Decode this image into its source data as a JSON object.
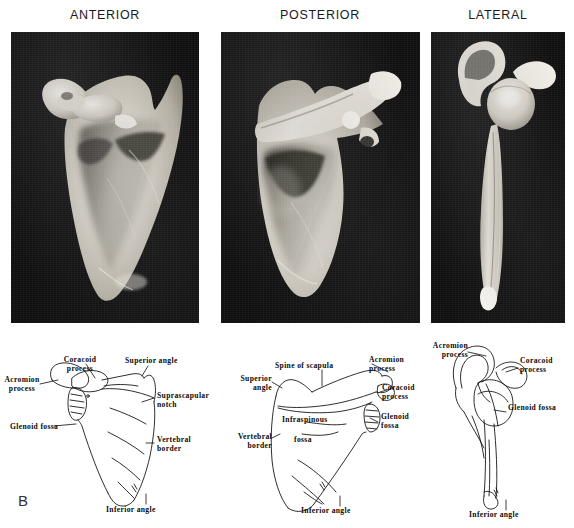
{
  "figure": {
    "panel_letter": "B",
    "background_color": "#ffffff",
    "ink_color": "#0a0a0a",
    "photo_background_color": "#0d0d0d",
    "bone_color": "#d8d4cc"
  },
  "columns": [
    {
      "heading": "ANTERIOR",
      "heading_x": 105,
      "heading_y": 8
    },
    {
      "heading": "POSTERIOR",
      "heading_x": 320,
      "heading_y": 8
    },
    {
      "heading": "LATERAL",
      "heading_x": 498,
      "heading_y": 8
    }
  ],
  "photo_panels": [
    {
      "name": "anterior-photo",
      "x": 11,
      "y": 32,
      "width": 188,
      "height": 291
    },
    {
      "name": "posterior-photo",
      "x": 221,
      "y": 32,
      "width": 199,
      "height": 291
    },
    {
      "name": "lateral-photo",
      "x": 431,
      "y": 32,
      "width": 134,
      "height": 291
    }
  ],
  "diagrams": [
    {
      "name": "anterior-diagram",
      "view": "ANTERIOR",
      "labels": [
        {
          "text": "Acromion\nprocess",
          "x": 4,
          "y": 376,
          "align": "left"
        },
        {
          "text": "Coracoid\nprocess",
          "x": 72,
          "y": 357,
          "align": "center"
        },
        {
          "text": "Superior angle",
          "x": 127,
          "y": 358,
          "align": "left"
        },
        {
          "text": "Suprascapular\nnotch",
          "x": 156,
          "y": 392,
          "align": "left"
        },
        {
          "text": "Glenoid fossa",
          "x": 14,
          "y": 424,
          "align": "left"
        },
        {
          "text": "Vertebral\nborder",
          "x": 155,
          "y": 437,
          "align": "left"
        },
        {
          "text": "Inferior angle",
          "x": 106,
          "y": 507,
          "align": "left"
        }
      ]
    },
    {
      "name": "posterior-diagram",
      "view": "POSTERIOR",
      "labels": [
        {
          "text": "Spine of scapula",
          "x": 277,
          "y": 363,
          "align": "left"
        },
        {
          "text": "Acromion\nprocess",
          "x": 372,
          "y": 357,
          "align": "left"
        },
        {
          "text": "Superior\nangle",
          "x": 234,
          "y": 376,
          "align": "left"
        },
        {
          "text": "Coracoid\nprocess",
          "x": 382,
          "y": 385,
          "align": "left"
        },
        {
          "text": "Infraspinous",
          "x": 282,
          "y": 417,
          "align": "left"
        },
        {
          "text": "Glenoid\nfossa",
          "x": 380,
          "y": 414,
          "align": "left"
        },
        {
          "text": "Vertebral\nborder",
          "x": 230,
          "y": 434,
          "align": "left"
        },
        {
          "text": "fossa",
          "x": 294,
          "y": 437,
          "align": "left"
        },
        {
          "text": "Inferior angle",
          "x": 300,
          "y": 508,
          "align": "left"
        }
      ]
    },
    {
      "name": "lateral-diagram",
      "view": "LATERAL",
      "labels": [
        {
          "text": "Acromion\nprocess",
          "x": 421,
          "y": 343,
          "align": "left"
        },
        {
          "text": "Coracoid\nprocess",
          "x": 520,
          "y": 358,
          "align": "left"
        },
        {
          "text": "Glenoid fossa",
          "x": 508,
          "y": 405,
          "align": "left"
        },
        {
          "text": "Inferior angle",
          "x": 469,
          "y": 512,
          "align": "left"
        }
      ]
    }
  ]
}
